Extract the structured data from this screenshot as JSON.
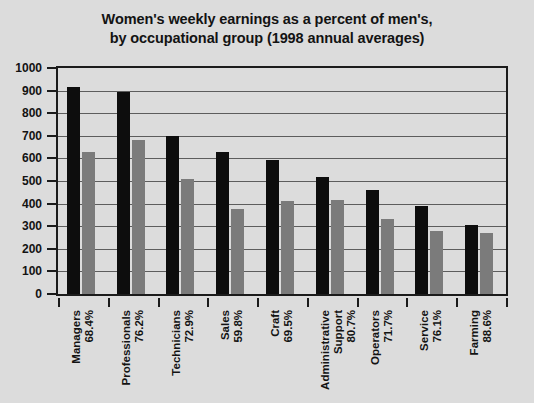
{
  "chart_data": {
    "type": "bar",
    "title": "Women's weekly earnings as a percent of men's, by occupational group (1998 annual averages)",
    "title_lines": [
      "Women's weekly earnings as a percent of men's,",
      "by occupational group (1998 annual averages)"
    ],
    "xlabel": "",
    "ylabel": "",
    "ylim": [
      0,
      1000
    ],
    "ytick_step": 100,
    "grid": true,
    "legend": null,
    "categories": [
      "Managers",
      "Professionals",
      "Technicians",
      "Sales",
      "Craft",
      "Administrative Support",
      "Operators",
      "Service",
      "Farming"
    ],
    "category_lines": [
      [
        "Managers"
      ],
      [
        "Professionals"
      ],
      [
        "Technicians"
      ],
      [
        "Sales"
      ],
      [
        "Craft"
      ],
      [
        "Administrative",
        "Support"
      ],
      [
        "Operators"
      ],
      [
        "Service"
      ],
      [
        "Farming"
      ]
    ],
    "percent_labels": [
      "68.4%",
      "76.2%",
      "72.9%",
      "59.8%",
      "69.5%",
      "80.7%",
      "71.7%",
      "76.1%",
      "88.6%"
    ],
    "series": [
      {
        "name": "Men",
        "color": "#0d0d0d",
        "values": [
          917,
          895,
          700,
          630,
          592,
          516,
          460,
          391,
          307
        ]
      },
      {
        "name": "Women",
        "color": "#7b7b7b",
        "values": [
          627,
          682,
          510,
          377,
          411,
          416,
          330,
          277,
          272
        ]
      }
    ],
    "ytick_labels": [
      "1000",
      "900",
      "800",
      "700",
      "600",
      "500",
      "400",
      "300",
      "200",
      "100",
      "0"
    ],
    "ytick_values": [
      1000,
      900,
      800,
      700,
      600,
      500,
      400,
      300,
      200,
      100,
      0
    ]
  },
  "colors": {
    "background": "#dcdcdc",
    "axis": "#1b1b1b",
    "gridline": "#5d5d5d",
    "text": "#131313",
    "series_primary": "#0d0d0d",
    "series_secondary": "#7b7b7b"
  }
}
